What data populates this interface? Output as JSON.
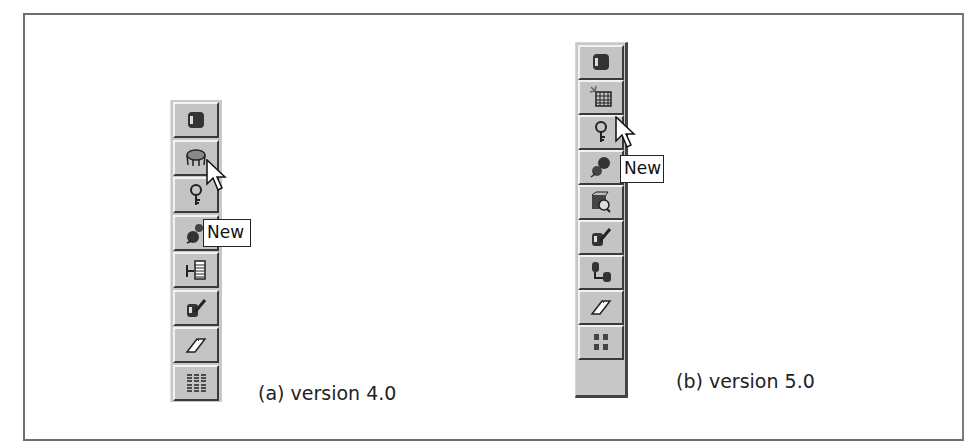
{
  "figure": {
    "version4": {
      "caption": "(a) version 4.0",
      "tooltip": "New",
      "buttons": [
        {
          "icon": "database-cylinder-icon"
        },
        {
          "icon": "new-table-icon"
        },
        {
          "icon": "key-icon"
        },
        {
          "icon": "relationship-icon"
        },
        {
          "icon": "index-icon"
        },
        {
          "icon": "modify-icon"
        },
        {
          "icon": "eraser-icon"
        },
        {
          "icon": "grid-icon"
        }
      ]
    },
    "version5": {
      "caption": "(b) version 5.0",
      "tooltip": "New",
      "buttons": [
        {
          "icon": "database-cylinder-icon"
        },
        {
          "icon": "new-table-icon"
        },
        {
          "icon": "key-icon"
        },
        {
          "icon": "relationship-icon"
        },
        {
          "icon": "query-icon"
        },
        {
          "icon": "modify-icon"
        },
        {
          "icon": "link-icon"
        },
        {
          "icon": "eraser-icon"
        },
        {
          "icon": "arrange-icon"
        }
      ]
    }
  }
}
